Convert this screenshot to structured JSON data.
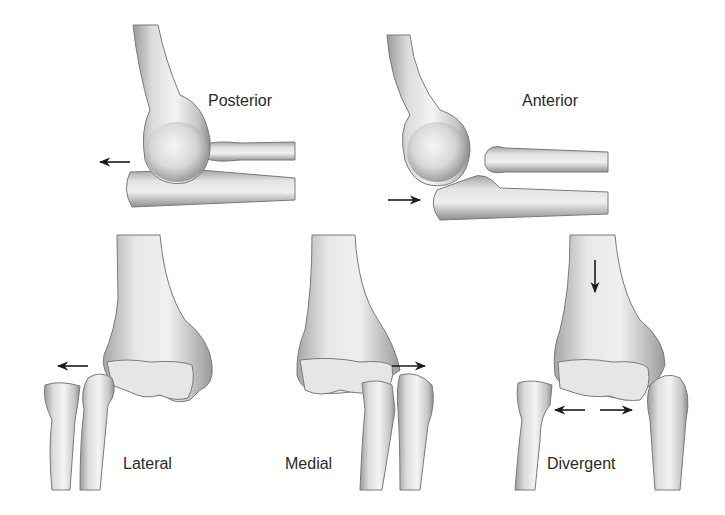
{
  "figure": {
    "panels": [
      {
        "id": "posterior",
        "label": "Posterior",
        "arrow": "left"
      },
      {
        "id": "anterior",
        "label": "Anterior",
        "arrow": "right"
      },
      {
        "id": "lateral",
        "label": "Lateral",
        "arrow": "left"
      },
      {
        "id": "medial",
        "label": "Medial",
        "arrow": "right"
      },
      {
        "id": "divergent",
        "label": "Divergent",
        "arrow": "down and bidirectional horizontal"
      }
    ]
  },
  "colors": {
    "background": "#ffffff",
    "bone_light": "#f2f2f2",
    "bone_mid": "#c8c8c8",
    "bone_dark": "#8a8a8a",
    "outline": "#6e6e6e",
    "arrow": "#1a1a1a",
    "text": "#2a2a2a"
  }
}
